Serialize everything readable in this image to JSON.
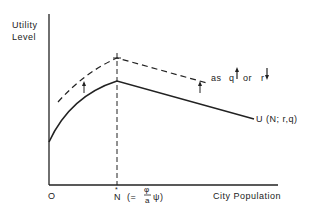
{
  "diagram": {
    "y_axis_label_line1": "Utility",
    "y_axis_label_line2": "Level",
    "x_axis_label": "City Population",
    "origin_label": "O",
    "peak_label": "N",
    "peak_label_accent": "*",
    "peak_formula_prefix": "(=",
    "peak_formula_num": "φ",
    "peak_formula_den": "a",
    "peak_formula_suffix": "ψ)",
    "curve_label": "U (N; r,q)",
    "shift_label_as": "as",
    "shift_label_q": "q",
    "shift_label_or": "or",
    "shift_label_r": "r",
    "colors": {
      "line": "#222222",
      "background": "#ffffff"
    }
  }
}
